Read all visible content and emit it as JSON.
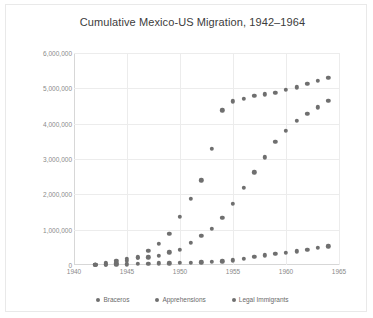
{
  "chart_data": {
    "type": "scatter",
    "title": "Cumulative Mexico-US Migration, 1942–1964",
    "xlabel": "",
    "ylabel": "",
    "xlim": [
      1940,
      1965
    ],
    "ylim": [
      0,
      6000000
    ],
    "xticks": [
      1940,
      1945,
      1950,
      1955,
      1960,
      1965
    ],
    "xtick_labels": [
      "1940",
      "1945",
      "1950",
      "1955",
      "1960",
      "1965"
    ],
    "yticks": [
      0,
      1000000,
      2000000,
      3000000,
      4000000,
      5000000,
      6000000
    ],
    "ytick_labels": [
      "0",
      "1,000,000",
      "2,000,000",
      "3,000,000",
      "4,000,000",
      "5,000,000",
      "6,000,000"
    ],
    "grid": true,
    "legend_position": "bottom",
    "marker_color": "#6f6f6f",
    "x": [
      1942,
      1943,
      1944,
      1945,
      1946,
      1947,
      1948,
      1949,
      1950,
      1951,
      1952,
      1953,
      1954,
      1955,
      1956,
      1957,
      1958,
      1959,
      1960,
      1961,
      1962,
      1963,
      1964
    ],
    "series": [
      {
        "name": "Braceros",
        "values": [
          4200,
          56000,
          118000,
          168000,
          200000,
          220000,
          255000,
          363000,
          430000,
          622000,
          819000,
          1020000,
          1330000,
          1730000,
          2180000,
          2620000,
          3050000,
          3480000,
          3800000,
          4080000,
          4280000,
          4460000,
          4650000
        ]
      },
      {
        "name": "Apprehensions",
        "values": [
          12000,
          20000,
          46000,
          116000,
          215000,
          409000,
          602000,
          891000,
          1360000,
          1870000,
          2400000,
          3280000,
          4380000,
          4630000,
          4710000,
          4780000,
          4830000,
          4880000,
          4950000,
          5030000,
          5130000,
          5220000,
          5300000
        ]
      },
      {
        "name": "Legal Immigrants",
        "values": [
          2400,
          6500,
          13000,
          20000,
          27000,
          35000,
          43000,
          51000,
          57000,
          63000,
          72000,
          90000,
          107000,
          135000,
          180000,
          230000,
          275000,
          312000,
          345000,
          388000,
          430000,
          480000,
          530000
        ]
      }
    ]
  },
  "legend": {
    "items": [
      {
        "label": "Braceros"
      },
      {
        "label": "Apprehensions"
      },
      {
        "label": "Legal Immigrants"
      }
    ]
  }
}
